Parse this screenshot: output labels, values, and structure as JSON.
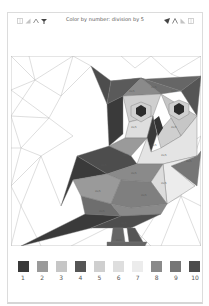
{
  "header": {
    "title": "Color by number: division by 5",
    "left_icons": [
      "grid-icon",
      "triangle-icon",
      "owl-ears-icon",
      "brush-icon"
    ],
    "right_icons": [
      "paint-bucket-icon",
      "pencil-icon",
      "triangle-icon",
      "grid-icon"
    ]
  },
  "artwork": {
    "subject": "owl",
    "cell_label": "20/5"
  },
  "palette": [
    {
      "number": "1",
      "color": "#3a3a3a"
    },
    {
      "number": "2",
      "color": "#9a9a9a"
    },
    {
      "number": "3",
      "color": "#c6c6c6"
    },
    {
      "number": "4",
      "color": "#555555"
    },
    {
      "number": "5",
      "color": "#cfcfcf"
    },
    {
      "number": "6",
      "color": "#dedede"
    },
    {
      "number": "7",
      "color": "#ececec"
    },
    {
      "number": "8",
      "color": "#8a8a8a"
    },
    {
      "number": "9",
      "color": "#767676"
    },
    {
      "number": "10",
      "color": "#4d4d4d"
    }
  ]
}
